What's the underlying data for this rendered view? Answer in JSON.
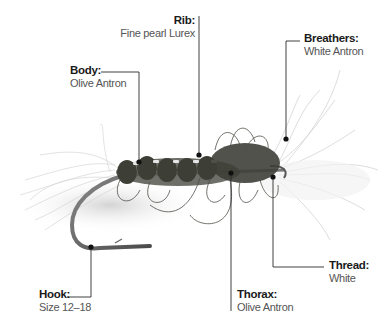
{
  "diagram": {
    "parts": [
      {
        "id": "rib",
        "title": "Rib:",
        "value": "Fine pearl Lurex"
      },
      {
        "id": "body",
        "title": "Body:",
        "value": "Olive Antron"
      },
      {
        "id": "breathers",
        "title": "Breathers:",
        "value": "White Antron"
      },
      {
        "id": "thread",
        "title": "Thread:",
        "value": "White"
      },
      {
        "id": "thorax",
        "title": "Thorax:",
        "value": "Olive Antron"
      },
      {
        "id": "hook",
        "title": "Hook:",
        "value": "Size 12–18"
      }
    ],
    "colors": {
      "leader": "#2a2a2a",
      "title_text": "#1a1a1a",
      "value_text": "#555555",
      "dubbing": "#3d3f37",
      "fibres": "#bdbdbd",
      "hook": "#6a6a6a"
    }
  }
}
